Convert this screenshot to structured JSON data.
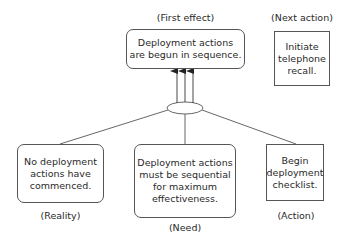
{
  "diagram": {
    "type": "cause-effect",
    "nodes": {
      "first_effect": {
        "caption": "(First effect)",
        "lines": [
          "Deployment actions",
          "are begun in sequence."
        ],
        "shape": "rounded-rectangle"
      },
      "next_action": {
        "caption": "(Next action)",
        "lines": [
          "Initiate",
          "telephone",
          "recall."
        ],
        "shape": "rectangle"
      },
      "reality": {
        "caption": "(Reality)",
        "lines": [
          "No deployment",
          "actions have",
          "commenced."
        ],
        "shape": "rounded-rectangle"
      },
      "need": {
        "caption": "(Need)",
        "lines": [
          "Deployment actions",
          "must be sequential",
          "for maximum",
          "effectiveness."
        ],
        "shape": "rounded-rectangle"
      },
      "action": {
        "caption": "(Action)",
        "lines": [
          "Begin",
          "deployment",
          "checklist."
        ],
        "shape": "rectangle"
      }
    },
    "connector": {
      "type": "ellipse-and-junction",
      "arrows_to_first_effect": 3
    },
    "edges": [
      {
        "from": "reality",
        "to": "junction"
      },
      {
        "from": "need",
        "to": "junction"
      },
      {
        "from": "action",
        "to": "junction"
      },
      {
        "from": "junction",
        "to": "first_effect"
      }
    ],
    "colors": {
      "stroke": "#555555",
      "text": "#2a2a2a",
      "background": "#ffffff"
    }
  }
}
